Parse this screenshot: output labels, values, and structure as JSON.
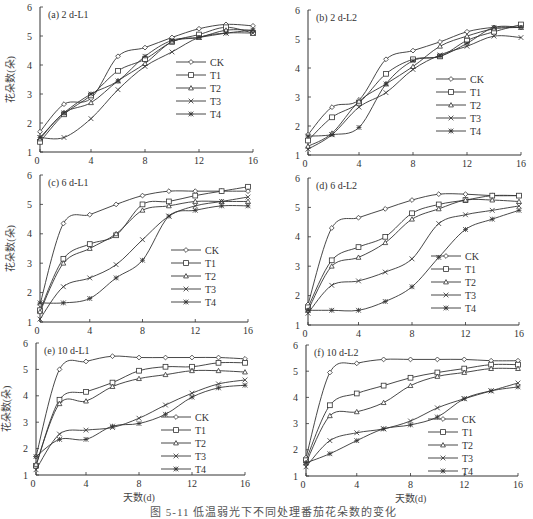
{
  "figure": {
    "caption": "图 5-11   低温弱光下不同处理番茄花朵数的变化",
    "ylabel": "花朵数(朵)",
    "xlabel": "天数(d)"
  },
  "legend": [
    "CK",
    "T1",
    "T2",
    "T3",
    "T4"
  ],
  "chart_data": [
    {
      "type": "line",
      "title": "(a) 2 d-L1",
      "xlabel": "",
      "ylabel": "花朵数(朵)",
      "xlim": [
        0,
        16
      ],
      "ylim": [
        1,
        6
      ],
      "xticks": [
        0,
        4,
        8,
        12,
        16
      ],
      "yticks": [
        1,
        2,
        3,
        4,
        5,
        6
      ],
      "x": [
        0,
        2,
        4,
        6,
        8,
        10,
        12,
        14,
        16
      ],
      "series": [
        {
          "name": "CK",
          "marker": "diamond",
          "values": [
            1.7,
            2.65,
            2.85,
            4.3,
            4.6,
            4.95,
            5.25,
            5.4,
            5.35
          ]
        },
        {
          "name": "T1",
          "marker": "square",
          "values": [
            1.35,
            2.3,
            2.95,
            3.8,
            4.2,
            4.8,
            5.05,
            5.3,
            5.1
          ]
        },
        {
          "name": "T2",
          "marker": "triangle",
          "values": [
            1.45,
            2.35,
            2.7,
            3.45,
            4.05,
            4.8,
            4.95,
            5.2,
            5.2
          ]
        },
        {
          "name": "T3",
          "marker": "x",
          "values": [
            1.5,
            1.5,
            2.15,
            3.15,
            3.95,
            4.45,
            4.95,
            5.1,
            5.1
          ]
        },
        {
          "name": "T4",
          "marker": "asterisk",
          "values": [
            1.5,
            2.35,
            3.0,
            3.45,
            4.3,
            4.85,
            4.95,
            5.1,
            5.2
          ]
        }
      ],
      "legend_position": "right-middle",
      "grid": false
    },
    {
      "type": "line",
      "title": "(b) 2 d-L2",
      "xlabel": "",
      "ylabel": "",
      "xlim": [
        0,
        16
      ],
      "ylim": [
        1,
        6
      ],
      "xticks": [
        0,
        4,
        8,
        12,
        16
      ],
      "yticks": [
        1,
        2,
        3,
        4,
        5,
        6
      ],
      "x": [
        0,
        2,
        4,
        6,
        8,
        10,
        12,
        14,
        16
      ],
      "series": [
        {
          "name": "CK",
          "marker": "diamond",
          "values": [
            1.7,
            2.65,
            2.9,
            4.3,
            4.6,
            4.9,
            5.25,
            5.4,
            5.4
          ]
        },
        {
          "name": "T1",
          "marker": "square",
          "values": [
            1.5,
            2.3,
            2.8,
            3.8,
            4.3,
            4.4,
            4.95,
            5.25,
            5.5
          ]
        },
        {
          "name": "T2",
          "marker": "triangle",
          "values": [
            1.3,
            1.75,
            2.85,
            3.45,
            4.05,
            4.75,
            5.1,
            5.35,
            5.4
          ]
        },
        {
          "name": "T3",
          "marker": "x",
          "values": [
            1.2,
            1.7,
            2.65,
            3.15,
            3.95,
            4.45,
            4.75,
            5.1,
            5.05
          ]
        },
        {
          "name": "T4",
          "marker": "asterisk",
          "values": [
            1.65,
            1.7,
            1.95,
            3.45,
            4.25,
            4.4,
            4.85,
            5.4,
            5.4
          ]
        }
      ],
      "legend_position": "right-middle",
      "grid": false
    },
    {
      "type": "line",
      "title": "(c) 6 d-L1",
      "xlabel": "",
      "ylabel": "花朵数(朵)",
      "xlim": [
        0,
        16
      ],
      "ylim": [
        1,
        6
      ],
      "xticks": [
        0,
        4,
        8,
        12,
        16
      ],
      "yticks": [
        1,
        2,
        3,
        4,
        5,
        6
      ],
      "x": [
        0,
        2,
        4,
        6,
        8,
        10,
        12,
        14,
        16
      ],
      "series": [
        {
          "name": "CK",
          "marker": "diamond",
          "values": [
            1.6,
            4.35,
            4.65,
            5.0,
            5.3,
            5.45,
            5.45,
            5.45,
            5.45
          ]
        },
        {
          "name": "T1",
          "marker": "square",
          "values": [
            1.4,
            3.15,
            3.65,
            3.95,
            5.0,
            5.1,
            5.3,
            5.45,
            5.6
          ]
        },
        {
          "name": "T2",
          "marker": "triangle",
          "values": [
            1.35,
            3.0,
            3.5,
            4.0,
            4.8,
            4.95,
            5.1,
            5.1,
            5.1
          ]
        },
        {
          "name": "T3",
          "marker": "x",
          "values": [
            1.1,
            2.2,
            2.5,
            2.95,
            3.8,
            4.6,
            4.95,
            5.1,
            5.25
          ]
        },
        {
          "name": "T4",
          "marker": "asterisk",
          "values": [
            1.65,
            1.65,
            1.8,
            2.5,
            3.1,
            4.6,
            4.8,
            4.95,
            4.95
          ]
        }
      ],
      "legend_position": "right-lower",
      "grid": false
    },
    {
      "type": "line",
      "title": "(d) 6 d-L2",
      "xlabel": "",
      "ylabel": "",
      "xlim": [
        0,
        16
      ],
      "ylim": [
        1,
        6
      ],
      "xticks": [
        0,
        4,
        8,
        12,
        16
      ],
      "yticks": [
        1,
        2,
        3,
        4,
        5,
        6
      ],
      "x": [
        0,
        2,
        4,
        6,
        8,
        10,
        12,
        14,
        16
      ],
      "series": [
        {
          "name": "CK",
          "marker": "diamond",
          "values": [
            1.7,
            4.3,
            4.65,
            4.95,
            5.25,
            5.45,
            5.45,
            5.4,
            5.4
          ]
        },
        {
          "name": "T1",
          "marker": "square",
          "values": [
            1.6,
            3.2,
            3.65,
            4.0,
            4.8,
            5.1,
            5.25,
            5.4,
            5.4
          ]
        },
        {
          "name": "T2",
          "marker": "triangle",
          "values": [
            1.5,
            3.0,
            3.3,
            3.8,
            4.6,
            4.95,
            5.25,
            5.25,
            5.2
          ]
        },
        {
          "name": "T3",
          "marker": "x",
          "values": [
            1.4,
            2.35,
            2.5,
            2.8,
            3.25,
            4.45,
            4.75,
            4.9,
            5.05
          ]
        },
        {
          "name": "T4",
          "marker": "asterisk",
          "values": [
            1.5,
            1.5,
            1.5,
            1.8,
            2.3,
            3.3,
            4.25,
            4.6,
            4.9
          ]
        }
      ],
      "legend_position": "right-lower",
      "grid": false
    },
    {
      "type": "line",
      "title": "(e) 10 d-L1",
      "xlabel": "天数(d)",
      "ylabel": "花朵数(朵)",
      "xlim": [
        0,
        16
      ],
      "ylim": [
        1,
        6
      ],
      "xticks": [
        0,
        4,
        8,
        12,
        16
      ],
      "yticks": [
        1,
        2,
        3,
        4,
        5,
        6
      ],
      "x": [
        0,
        2,
        4,
        6,
        8,
        10,
        12,
        14,
        16
      ],
      "series": [
        {
          "name": "CK",
          "marker": "diamond",
          "values": [
            1.7,
            5.0,
            5.3,
            5.5,
            5.45,
            5.45,
            5.45,
            5.45,
            5.4
          ]
        },
        {
          "name": "T1",
          "marker": "square",
          "values": [
            1.35,
            3.85,
            4.15,
            4.5,
            4.95,
            5.1,
            5.1,
            5.25,
            5.25
          ]
        },
        {
          "name": "T2",
          "marker": "triangle",
          "values": [
            1.4,
            3.7,
            3.8,
            4.35,
            4.65,
            4.8,
            4.95,
            4.95,
            4.9
          ]
        },
        {
          "name": "T3",
          "marker": "x",
          "values": [
            1.2,
            2.55,
            2.7,
            2.8,
            3.15,
            3.65,
            4.1,
            4.45,
            4.6
          ]
        },
        {
          "name": "T4",
          "marker": "asterisk",
          "values": [
            1.7,
            2.35,
            2.35,
            2.85,
            2.95,
            3.3,
            3.95,
            4.3,
            4.4
          ]
        }
      ],
      "legend_position": "right-lower",
      "grid": false
    },
    {
      "type": "line",
      "title": "(f) 10 d-L2",
      "xlabel": "天数(d)",
      "ylabel": "",
      "xlim": [
        0,
        16
      ],
      "ylim": [
        1,
        6
      ],
      "xticks": [
        0,
        4,
        8,
        12,
        16
      ],
      "yticks": [
        1,
        2,
        3,
        4,
        5,
        6
      ],
      "x": [
        0,
        2,
        4,
        6,
        8,
        10,
        12,
        14,
        16
      ],
      "series": [
        {
          "name": "CK",
          "marker": "diamond",
          "values": [
            1.7,
            4.95,
            5.3,
            5.45,
            5.45,
            5.45,
            5.45,
            5.4,
            5.4
          ]
        },
        {
          "name": "T1",
          "marker": "square",
          "values": [
            1.6,
            3.7,
            4.15,
            4.45,
            4.75,
            4.95,
            5.1,
            5.25,
            5.25
          ]
        },
        {
          "name": "T2",
          "marker": "triangle",
          "values": [
            1.5,
            3.3,
            3.45,
            3.8,
            4.45,
            4.8,
            4.95,
            5.1,
            5.1
          ]
        },
        {
          "name": "T3",
          "marker": "x",
          "values": [
            1.35,
            2.35,
            2.65,
            2.8,
            3.1,
            3.6,
            3.95,
            4.25,
            4.55
          ]
        },
        {
          "name": "T4",
          "marker": "asterisk",
          "values": [
            1.5,
            1.85,
            2.35,
            2.8,
            2.95,
            3.25,
            3.95,
            4.25,
            4.4
          ]
        }
      ],
      "legend_position": "right-lower",
      "grid": false
    }
  ]
}
